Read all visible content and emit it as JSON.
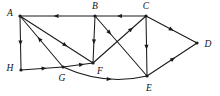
{
  "figure": {
    "width": 220,
    "height": 96,
    "background_color": "#ffffff",
    "stroke_color": "#1a1a1a",
    "label_color": "#111111"
  },
  "vertices": [
    {
      "id": "A",
      "label": "A",
      "x": 20,
      "y": 16,
      "label_x": 10,
      "label_y": 14
    },
    {
      "id": "B",
      "label": "B",
      "x": 95,
      "y": 16,
      "label_x": 95,
      "label_y": 7
    },
    {
      "id": "C",
      "label": "C",
      "x": 146,
      "y": 16,
      "label_x": 146,
      "label_y": 7
    },
    {
      "id": "D",
      "label": "D",
      "x": 197,
      "y": 43,
      "label_x": 208,
      "label_y": 45
    },
    {
      "id": "E",
      "label": "E",
      "x": 147,
      "y": 76,
      "label_x": 149,
      "label_y": 89
    },
    {
      "id": "F",
      "label": "F",
      "x": 93,
      "y": 63,
      "label_x": 100,
      "label_y": 72
    },
    {
      "id": "G",
      "label": "G",
      "x": 63,
      "y": 67,
      "label_x": 62,
      "label_y": 79
    },
    {
      "id": "H",
      "label": "H",
      "x": 21,
      "y": 70,
      "label_x": 10,
      "label_y": 69
    }
  ],
  "edges": [
    {
      "id": "B-A",
      "from": "B",
      "to": "A",
      "direction": "B to A",
      "shape": "line",
      "arrow_position": 0.52
    },
    {
      "id": "C-B",
      "from": "C",
      "to": "B",
      "direction": "C to B",
      "shape": "line",
      "arrow_position": 0.52
    },
    {
      "id": "A-H",
      "from": "A",
      "to": "H",
      "direction": "A to H",
      "shape": "line",
      "arrow_position": 0.5
    },
    {
      "id": "A-F",
      "from": "A",
      "to": "F",
      "direction": "A to F",
      "shape": "line",
      "arrow_position": 0.62
    },
    {
      "id": "G-A",
      "from": "G",
      "to": "A",
      "direction": "G to A",
      "shape": "line",
      "arrow_position": 0.55
    },
    {
      "id": "H-G",
      "from": "H",
      "to": "G",
      "direction": "H to G",
      "shape": "line",
      "arrow_position": 0.55
    },
    {
      "id": "G-F",
      "from": "G",
      "to": "F",
      "direction": "G to F",
      "shape": "line",
      "arrow_position": 0.62
    },
    {
      "id": "B-F",
      "from": "B",
      "to": "F",
      "direction": "B to F",
      "shape": "line",
      "arrow_position": 0.55
    },
    {
      "id": "B-E",
      "from": "B",
      "to": "E",
      "direction": "B to E",
      "shape": "line",
      "arrow_position": 0.28
    },
    {
      "id": "F-C",
      "from": "F",
      "to": "C",
      "direction": "F to C",
      "shape": "line",
      "arrow_position": 0.72
    },
    {
      "id": "C-E",
      "from": "C",
      "to": "E",
      "direction": "C to E",
      "shape": "line",
      "arrow_position": 0.52
    },
    {
      "id": "C-D",
      "from": "C",
      "to": "D",
      "direction": "C to D",
      "shape": "line",
      "arrow_position": 0.5
    },
    {
      "id": "E-D",
      "from": "E",
      "to": "D",
      "direction": "E to D",
      "shape": "line",
      "arrow_position": 0.52
    },
    {
      "id": "G-E",
      "from": "G",
      "to": "E",
      "direction": "G to E",
      "shape": "curve",
      "curve_control_x": 105,
      "curve_control_y": 86,
      "arrow_position": 0.55
    }
  ]
}
